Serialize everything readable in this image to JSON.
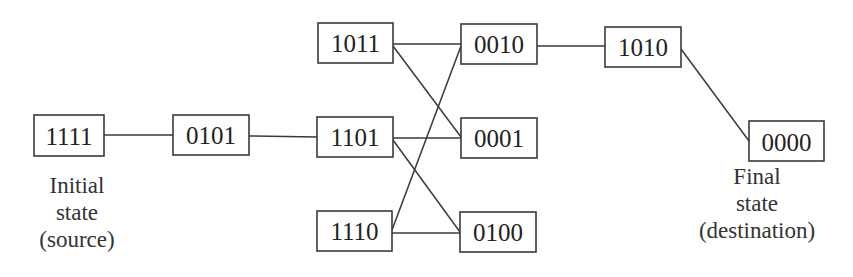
{
  "diagram": {
    "title": "",
    "nodes": [
      {
        "id": "1111",
        "label": "1111",
        "x": 34,
        "y": 115,
        "w": 70,
        "h": 41
      },
      {
        "id": "0101",
        "label": "0101",
        "x": 173,
        "y": 115,
        "w": 76,
        "h": 40
      },
      {
        "id": "1011",
        "label": "1011",
        "x": 318,
        "y": 23,
        "w": 75,
        "h": 40
      },
      {
        "id": "1101",
        "label": "1101",
        "x": 317,
        "y": 117,
        "w": 76,
        "h": 40
      },
      {
        "id": "1110",
        "label": "1110",
        "x": 317,
        "y": 211,
        "w": 75,
        "h": 40
      },
      {
        "id": "0010",
        "label": "0010",
        "x": 461,
        "y": 24,
        "w": 76,
        "h": 40
      },
      {
        "id": "0001",
        "label": "0001",
        "x": 461,
        "y": 118,
        "w": 76,
        "h": 40
      },
      {
        "id": "0100",
        "label": "0100",
        "x": 460,
        "y": 212,
        "w": 76,
        "h": 40
      },
      {
        "id": "1010",
        "label": "1010",
        "x": 605,
        "y": 27,
        "w": 76,
        "h": 40
      },
      {
        "id": "0000",
        "label": "0000",
        "x": 749,
        "y": 121,
        "w": 75,
        "h": 40
      }
    ],
    "edges": [
      {
        "from": "1111",
        "to": "0101"
      },
      {
        "from": "0101",
        "to": "1101"
      },
      {
        "from": "1011",
        "to": "0010"
      },
      {
        "from": "1011",
        "to": "0001"
      },
      {
        "from": "1101",
        "to": "0001"
      },
      {
        "from": "1101",
        "to": "0100"
      },
      {
        "from": "1110",
        "to": "0010"
      },
      {
        "from": "1110",
        "to": "0100"
      },
      {
        "from": "0010",
        "to": "1010"
      },
      {
        "from": "1010",
        "to": "0000"
      }
    ],
    "captions": {
      "source": {
        "lines": [
          "Initial",
          "state",
          "(source)"
        ],
        "attached_to": "1111"
      },
      "destination": {
        "lines": [
          "Final",
          "state",
          "(destination)"
        ],
        "attached_to": "0000"
      }
    }
  }
}
